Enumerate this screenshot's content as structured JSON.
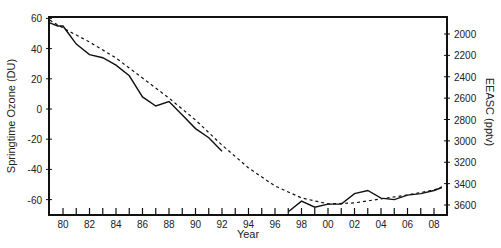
{
  "chart_data": {
    "type": "line",
    "title": "",
    "xlabel": "Year",
    "ylabel_left": "Springtime Ozone (DU)",
    "ylabel_right": "EEASC (pptv)",
    "xlim": [
      1979,
      2008.7
    ],
    "ylim_left": [
      -70,
      62
    ],
    "ylim_right_inverted": [
      1860,
      3680
    ],
    "grid": false,
    "legend": null,
    "x_tick_labels": [
      "80",
      "82",
      "84",
      "86",
      "88",
      "90",
      "92",
      "94",
      "96",
      "98",
      "00",
      "02",
      "04",
      "06",
      "08"
    ],
    "x_tick_values": [
      1980,
      1982,
      1984,
      1986,
      1988,
      1990,
      1992,
      1994,
      1996,
      1998,
      2000,
      2002,
      2004,
      2006,
      2008
    ],
    "y_left_tick_labels": [
      "60",
      "40",
      "20",
      "0",
      "-20",
      "-40",
      "-60"
    ],
    "y_left_tick_values": [
      60,
      40,
      20,
      0,
      -20,
      -40,
      -60
    ],
    "y_right_tick_labels": [
      "2000",
      "2200",
      "2400",
      "2600",
      "2800",
      "3000",
      "3200",
      "3400",
      "3600"
    ],
    "y_right_tick_values": [
      2000,
      2200,
      2400,
      2600,
      2800,
      3000,
      3200,
      3400,
      3600
    ],
    "series": [
      {
        "name": "Springtime Ozone (DU)",
        "axis": "left",
        "style": "solid",
        "segments": [
          {
            "x": [
              1979,
              1979.6,
              1980,
              1980.5,
              1981,
              1982,
              1983,
              1984,
              1985,
              1986,
              1987,
              1988,
              1989,
              1990,
              1991,
              1992
            ],
            "y": [
              57,
              55,
              55,
              49,
              43,
              36,
              34,
              29,
              22,
              8,
              2,
              5,
              -4,
              -13,
              -19,
              -28
            ]
          },
          {
            "x": [
              1997,
              1998,
              1999,
              2000,
              2001,
              2002,
              2003,
              2004,
              2005,
              2006,
              2007,
              2008,
              2008.6
            ],
            "y": [
              -68,
              -61,
              -65,
              -63,
              -63,
              -56,
              -54,
              -59,
              -60,
              -57,
              -56,
              -54,
              -52
            ]
          }
        ]
      },
      {
        "name": "EEASC (pptv)",
        "axis": "right",
        "style": "dashed",
        "x": [
          1979,
          1980,
          1982,
          1984,
          1986,
          1988,
          1990,
          1992,
          1994,
          1996,
          1998,
          2000,
          2002,
          2004,
          2006,
          2008,
          2008.6
        ],
        "y": [
          1870,
          1944,
          2075,
          2225,
          2412,
          2600,
          2805,
          3040,
          3253,
          3422,
          3534,
          3590,
          3580,
          3543,
          3506,
          3460,
          3430
        ]
      }
    ]
  }
}
